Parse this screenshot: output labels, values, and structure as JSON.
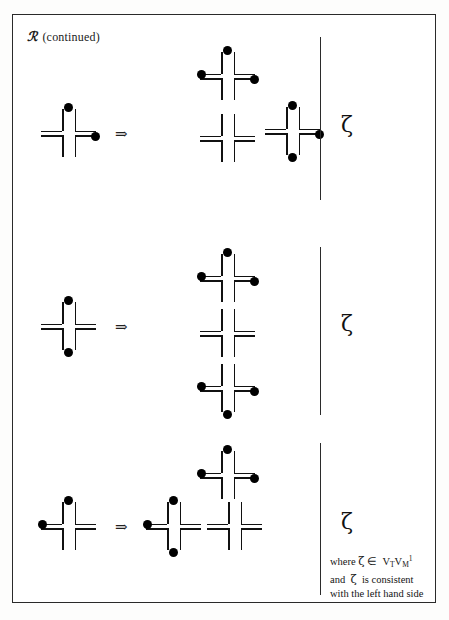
{
  "figure": {
    "caption_symbol": "ℛ",
    "caption_text": "(continued)",
    "arrow_glyph": "⇒",
    "zeta_glyph": "ζ",
    "border_color": "#2a2a2a",
    "ink_color": "#111111",
    "paper_color": "#ffffff"
  },
  "note": {
    "line1_prefix": "where",
    "line1_zeta": "ζ",
    "line1_in": "∈",
    "line1_set_v1": "V",
    "line1_set_v1_sub": "T",
    "line1_set_v2": "V",
    "line1_set_v2_sub": "M",
    "line1_set_v2_sup": "1",
    "line2_prefix": "and",
    "line2_zeta": "ζ",
    "line2_rest": "is   consistent",
    "line3": "with the left hand side"
  },
  "rules": [
    {
      "id": "rule-1",
      "lhs": {
        "dots": {
          "top": true,
          "bottom": false,
          "left": false,
          "right": true
        }
      },
      "rhs": [
        {
          "pos": "upper",
          "dots": {
            "top": true,
            "bottom": false,
            "left": true,
            "right": true
          }
        },
        {
          "pos": "lower-left",
          "dots": {
            "top": false,
            "bottom": false,
            "left": false,
            "right": false
          }
        },
        {
          "pos": "lower-right",
          "dots": {
            "top": true,
            "bottom": true,
            "left": false,
            "right": true
          }
        }
      ],
      "label": "ζ"
    },
    {
      "id": "rule-2",
      "lhs": {
        "dots": {
          "top": true,
          "bottom": true,
          "left": false,
          "right": false
        }
      },
      "rhs": [
        {
          "pos": "top",
          "dots": {
            "top": true,
            "bottom": false,
            "left": true,
            "right": true
          }
        },
        {
          "pos": "middle",
          "dots": {
            "top": false,
            "bottom": false,
            "left": false,
            "right": false
          }
        },
        {
          "pos": "bottom",
          "dots": {
            "top": false,
            "bottom": true,
            "left": true,
            "right": true
          }
        }
      ],
      "label": "ζ"
    },
    {
      "id": "rule-3",
      "lhs": {
        "dots": {
          "top": true,
          "bottom": false,
          "left": true,
          "right": false
        }
      },
      "rhs": [
        {
          "pos": "lower-left",
          "dots": {
            "top": true,
            "bottom": true,
            "left": true,
            "right": false
          }
        },
        {
          "pos": "lower-right",
          "dots": {
            "top": false,
            "bottom": false,
            "left": false,
            "right": false
          }
        },
        {
          "pos": "upper",
          "dots": {
            "top": true,
            "bottom": false,
            "left": true,
            "right": true
          }
        }
      ],
      "label": "ζ"
    }
  ]
}
